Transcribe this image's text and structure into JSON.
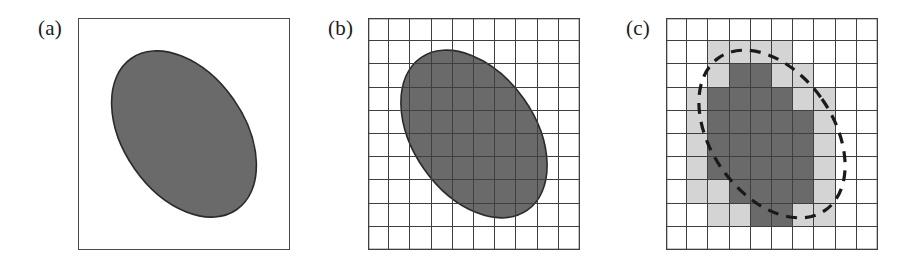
{
  "figure": {
    "caption_present": false,
    "panels": [
      {
        "id": "a",
        "label": "(a)",
        "description": "continuous grey ellipse inside a plain square frame",
        "frame": true,
        "grid": false,
        "dashed_outline": false
      },
      {
        "id": "b",
        "label": "(b)",
        "description": "same grey ellipse overlaid with a 10 by 10 sampling grid",
        "frame": false,
        "grid": true,
        "dashed_outline": false
      },
      {
        "id": "c",
        "label": "(c)",
        "description": "pixelated ellipse on the 10 by 10 grid with dashed original outline",
        "frame": false,
        "grid": true,
        "dashed_outline": true
      }
    ]
  },
  "colors": {
    "shape_fill": "#6a6a6a",
    "shape_stroke": "#2a2a2a",
    "partial_cell_fill": "#d4d4d4",
    "full_cell_fill": "#6a6a6a",
    "empty_cell_fill": "#ffffff",
    "grid_line": "#3f3f3f",
    "frame_line": "#4a4a4a",
    "dashed_outline": "#1a1a1a",
    "label_text": "#1a1a1a",
    "background": "#ffffff"
  },
  "chart_data": {
    "type": "diagram",
    "title": "",
    "grid": {
      "columns": 10,
      "rows": 10,
      "on": true
    },
    "ellipse": {
      "center_x_frac": 0.5,
      "center_y_frac": 0.5,
      "radius_x_frac": 0.29,
      "radius_y_frac": 0.4,
      "rotation_deg": -35
    },
    "pixel_map_legend": {
      "0": "empty",
      "1": "partial",
      "2": "full"
    },
    "pixel_map": [
      [
        0,
        0,
        0,
        0,
        0,
        0,
        0,
        0,
        0,
        0
      ],
      [
        0,
        0,
        1,
        1,
        1,
        1,
        0,
        0,
        0,
        0
      ],
      [
        0,
        0,
        1,
        2,
        2,
        1,
        1,
        0,
        0,
        0
      ],
      [
        0,
        1,
        2,
        2,
        2,
        2,
        1,
        1,
        0,
        0
      ],
      [
        0,
        1,
        2,
        2,
        2,
        2,
        2,
        1,
        0,
        0
      ],
      [
        0,
        1,
        2,
        2,
        2,
        2,
        2,
        1,
        0,
        0
      ],
      [
        0,
        1,
        2,
        2,
        2,
        2,
        2,
        1,
        0,
        0
      ],
      [
        0,
        1,
        1,
        2,
        2,
        2,
        2,
        1,
        0,
        0
      ],
      [
        0,
        0,
        1,
        1,
        2,
        2,
        1,
        1,
        0,
        0
      ],
      [
        0,
        0,
        0,
        0,
        0,
        0,
        0,
        0,
        0,
        0
      ]
    ]
  }
}
